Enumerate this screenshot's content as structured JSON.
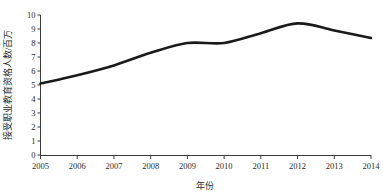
{
  "chart_data": {
    "type": "line",
    "title": "",
    "subtitle": "",
    "xlabel": "年份",
    "ylabel": "接受职业教育资格人数/百万",
    "categories": [
      "2005",
      "2006",
      "2007",
      "2008",
      "2009",
      "2010",
      "2011",
      "2012",
      "2013",
      "2014"
    ],
    "x": [
      2005,
      2006,
      2007,
      2008,
      2009,
      2010,
      2011,
      2012,
      2013,
      2014
    ],
    "values": [
      5.1,
      5.7,
      6.4,
      7.3,
      8.0,
      8.0,
      8.7,
      9.4,
      8.9,
      8.35
    ],
    "series": [
      {
        "name": "接受职业教育资格人数",
        "values": [
          5.1,
          5.7,
          6.4,
          7.3,
          8.0,
          8.0,
          8.7,
          9.4,
          8.9,
          8.35
        ],
        "color": "#1a1a1a"
      }
    ],
    "xlim": [
      2005,
      2014
    ],
    "ylim": [
      0,
      10
    ],
    "yticks": [
      "0",
      "1",
      "2",
      "3",
      "4",
      "5",
      "6",
      "7",
      "8",
      "9",
      "10"
    ],
    "ytick_values": [
      0,
      1,
      2,
      3,
      4,
      5,
      6,
      7,
      8,
      9,
      10
    ],
    "xticks": [
      "2005",
      "2006",
      "2007",
      "2008",
      "2009",
      "2010",
      "2011",
      "2012",
      "2013",
      "2014"
    ],
    "grid": false,
    "legend": false,
    "legend_position": "none",
    "line_color": "#1a1a1a",
    "axis_color": "#3a3a3a",
    "background_color": "#ffffff",
    "smoothing": "spline",
    "annotations": []
  }
}
